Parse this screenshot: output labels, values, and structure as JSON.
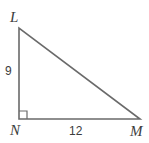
{
  "figure": {
    "type": "right-triangle",
    "stroke_color": "#6a6a6a",
    "text_color": "#3c3c3c",
    "background_color": "#ffffff",
    "vertices": [
      {
        "name": "L",
        "label": "L",
        "x": 19,
        "y": 28
      },
      {
        "name": "N",
        "label": "N",
        "x": 19,
        "y": 119
      },
      {
        "name": "M",
        "label": "M",
        "x": 140,
        "y": 119
      }
    ],
    "sides": [
      {
        "name": "LN",
        "label": "9",
        "from": "L",
        "to": "N",
        "orientation": "vertical"
      },
      {
        "name": "NM",
        "label": "12",
        "from": "N",
        "to": "M",
        "orientation": "horizontal"
      },
      {
        "name": "LM",
        "label": "",
        "from": "L",
        "to": "M",
        "orientation": "hypotenuse"
      }
    ],
    "right_angle": {
      "at_vertex": "N",
      "marker_size": 8
    },
    "labels": {
      "vertex_top": "L",
      "vertex_bottom_left": "N",
      "vertex_bottom_right": "M",
      "leg_vertical": "9",
      "leg_horizontal": "12"
    }
  }
}
